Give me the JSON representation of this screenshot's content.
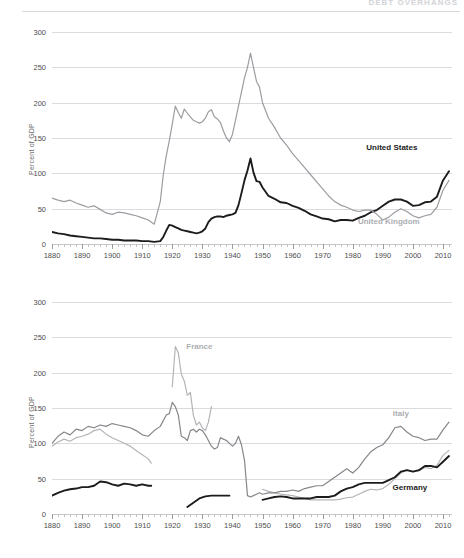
{
  "header": {
    "running_head": "DEBT OVERHANGS"
  },
  "chart_data": [
    {
      "id": "top",
      "type": "line",
      "title": "",
      "xlabel": "",
      "ylabel": "Percent of GDP",
      "xlim": [
        1880,
        2013
      ],
      "ylim": [
        0,
        300
      ],
      "yticks": [
        0,
        50,
        100,
        150,
        200,
        250,
        300
      ],
      "xticks": [
        1880,
        1890,
        1900,
        1910,
        1920,
        1930,
        1940,
        1950,
        1960,
        1970,
        1980,
        1990,
        2000,
        2010
      ],
      "grid": true,
      "legend_position": "inline-annotation",
      "annotations": [
        {
          "text": "United States",
          "x": 1993,
          "y": 137,
          "style": "dark"
        },
        {
          "text": "United Kingdom",
          "x": 1992,
          "y": 33,
          "style": "light"
        }
      ],
      "series": [
        {
          "name": "United States",
          "color": "#1c1c1c",
          "x": [
            1880,
            1882,
            1884,
            1886,
            1888,
            1890,
            1892,
            1894,
            1896,
            1898,
            1900,
            1902,
            1904,
            1906,
            1908,
            1910,
            1912,
            1914,
            1916,
            1917,
            1918,
            1919,
            1920,
            1921,
            1922,
            1923,
            1924,
            1925,
            1926,
            1927,
            1928,
            1929,
            1930,
            1931,
            1932,
            1933,
            1934,
            1935,
            1936,
            1937,
            1938,
            1939,
            1940,
            1941,
            1942,
            1943,
            1944,
            1945,
            1946,
            1947,
            1948,
            1949,
            1950,
            1952,
            1954,
            1956,
            1958,
            1960,
            1962,
            1964,
            1966,
            1968,
            1970,
            1972,
            1974,
            1976,
            1978,
            1980,
            1982,
            1984,
            1986,
            1988,
            1990,
            1992,
            1994,
            1996,
            1998,
            2000,
            2002,
            2004,
            2006,
            2008,
            2010,
            2012
          ],
          "values": [
            17,
            15,
            14,
            12,
            11,
            10,
            9,
            8,
            8,
            7,
            6,
            6,
            5,
            5,
            5,
            4,
            4,
            3,
            4,
            10,
            19,
            27,
            26,
            24,
            22,
            20,
            19,
            18,
            17,
            16,
            15,
            16,
            18,
            22,
            31,
            36,
            38,
            39,
            39,
            38,
            40,
            41,
            42,
            44,
            55,
            72,
            90,
            104,
            121,
            101,
            89,
            88,
            80,
            68,
            64,
            59,
            58,
            54,
            51,
            47,
            42,
            39,
            36,
            35,
            32,
            34,
            34,
            33,
            37,
            40,
            45,
            48,
            54,
            60,
            63,
            63,
            60,
            54,
            55,
            59,
            60,
            67,
            90,
            103
          ]
        },
        {
          "name": "United Kingdom",
          "color": "#9b9da0",
          "x": [
            1880,
            1882,
            1884,
            1886,
            1888,
            1890,
            1892,
            1894,
            1896,
            1898,
            1900,
            1902,
            1904,
            1906,
            1908,
            1910,
            1912,
            1914,
            1916,
            1917,
            1918,
            1919,
            1920,
            1921,
            1922,
            1923,
            1924,
            1925,
            1926,
            1927,
            1928,
            1929,
            1930,
            1931,
            1932,
            1933,
            1934,
            1935,
            1936,
            1937,
            1938,
            1939,
            1940,
            1941,
            1942,
            1943,
            1944,
            1945,
            1946,
            1947,
            1948,
            1949,
            1950,
            1952,
            1954,
            1956,
            1958,
            1960,
            1962,
            1964,
            1966,
            1968,
            1970,
            1972,
            1974,
            1976,
            1978,
            1980,
            1982,
            1984,
            1986,
            1988,
            1990,
            1992,
            1994,
            1996,
            1998,
            2000,
            2002,
            2004,
            2006,
            2008,
            2010,
            2012
          ],
          "values": [
            65,
            62,
            60,
            62,
            58,
            55,
            52,
            54,
            49,
            44,
            42,
            45,
            44,
            42,
            40,
            37,
            34,
            28,
            60,
            98,
            125,
            146,
            170,
            195,
            186,
            178,
            191,
            185,
            180,
            175,
            173,
            171,
            173,
            178,
            187,
            190,
            180,
            177,
            172,
            160,
            150,
            145,
            155,
            175,
            195,
            215,
            235,
            250,
            270,
            250,
            230,
            222,
            200,
            178,
            165,
            150,
            140,
            128,
            118,
            108,
            98,
            88,
            78,
            68,
            60,
            55,
            52,
            48,
            46,
            48,
            48,
            42,
            34,
            38,
            45,
            50,
            46,
            40,
            37,
            40,
            42,
            52,
            76,
            90
          ]
        }
      ]
    },
    {
      "id": "bottom",
      "type": "line",
      "title": "",
      "xlabel": "",
      "ylabel": "Percent of GDP",
      "xlim": [
        1880,
        2013
      ],
      "ylim": [
        0,
        300
      ],
      "yticks": [
        0,
        50,
        100,
        150,
        200,
        250,
        300
      ],
      "xticks": [
        1880,
        1890,
        1900,
        1910,
        1920,
        1930,
        1940,
        1950,
        1960,
        1970,
        1980,
        1990,
        2000,
        2010
      ],
      "grid": true,
      "legend_position": "inline-annotation",
      "annotations": [
        {
          "text": "France",
          "x": 1929,
          "y": 238,
          "style": "light"
        },
        {
          "text": "Italy",
          "x": 1996,
          "y": 143,
          "style": "light"
        },
        {
          "text": "Germany",
          "x": 1999,
          "y": 38,
          "style": "dark"
        }
      ],
      "series": [
        {
          "name": "France",
          "color": "#b4b5b8",
          "segments": [
            {
              "x": [
                1880,
                1882,
                1884,
                1886,
                1888,
                1890,
                1892,
                1894,
                1896,
                1898,
                1900,
                1902,
                1904,
                1906,
                1908,
                1910,
                1912,
                1913
              ],
              "values": [
                96,
                102,
                106,
                103,
                108,
                110,
                113,
                118,
                120,
                113,
                108,
                104,
                100,
                96,
                90,
                84,
                78,
                72
              ]
            },
            {
              "x": [
                1920,
                1921,
                1922,
                1923,
                1924,
                1925,
                1926,
                1927,
                1928,
                1929,
                1930,
                1931,
                1932,
                1933
              ],
              "values": [
                180,
                237,
                228,
                198,
                188,
                168,
                172,
                140,
                126,
                130,
                122,
                118,
                130,
                152
              ]
            },
            {
              "x": [
                1950,
                1952,
                1954,
                1956,
                1958,
                1960,
                1962,
                1964,
                1966,
                1968,
                1970,
                1972,
                1974,
                1976,
                1978,
                1980,
                1982,
                1984,
                1986,
                1988,
                1990,
                1992,
                1994,
                1996,
                1998,
                2000,
                2002,
                2004,
                2006,
                2008,
                2010,
                2012
              ],
              "values": [
                35,
                32,
                30,
                28,
                27,
                26,
                24,
                22,
                20,
                20,
                20,
                20,
                20,
                21,
                23,
                24,
                28,
                32,
                35,
                34,
                36,
                42,
                50,
                58,
                62,
                60,
                61,
                66,
                64,
                69,
                83,
                90
              ]
            }
          ]
        },
        {
          "name": "Italy",
          "color": "#85878a",
          "segments": [
            {
              "x": [
                1880,
                1882,
                1884,
                1886,
                1888,
                1890,
                1892,
                1894,
                1896,
                1898,
                1900,
                1902,
                1904,
                1906,
                1908,
                1910,
                1912,
                1914,
                1916,
                1918,
                1919,
                1920,
                1921,
                1922,
                1923,
                1924,
                1925,
                1926,
                1927,
                1928,
                1929,
                1930,
                1931,
                1932,
                1933,
                1934,
                1935,
                1936,
                1937,
                1938,
                1939,
                1940,
                1941,
                1942,
                1943,
                1944,
                1945,
                1946,
                1947,
                1948,
                1949,
                1950,
                1952,
                1954,
                1956,
                1958,
                1960,
                1962,
                1964,
                1966,
                1968,
                1970,
                1972,
                1974,
                1976,
                1978,
                1980,
                1982,
                1984,
                1986,
                1988,
                1990,
                1992,
                1994,
                1996,
                1998,
                2000,
                2002,
                2004,
                2006,
                2008,
                2010,
                2012
              ],
              "values": [
                100,
                110,
                116,
                112,
                120,
                118,
                124,
                122,
                126,
                124,
                128,
                126,
                124,
                122,
                118,
                112,
                110,
                118,
                124,
                140,
                142,
                158,
                152,
                140,
                110,
                108,
                104,
                118,
                120,
                116,
                120,
                118,
                112,
                104,
                96,
                92,
                94,
                108,
                106,
                104,
                100,
                96,
                100,
                110,
                98,
                76,
                26,
                24,
                26,
                28,
                30,
                28,
                30,
                30,
                32,
                32,
                34,
                32,
                36,
                38,
                40,
                40,
                46,
                52,
                58,
                64,
                58,
                66,
                78,
                88,
                94,
                98,
                108,
                122,
                124,
                116,
                110,
                108,
                104,
                106,
                106,
                119,
                130
              ]
            }
          ]
        },
        {
          "name": "Germany",
          "color": "#1c1c1c",
          "segments": [
            {
              "x": [
                1880,
                1882,
                1884,
                1886,
                1888,
                1890,
                1892,
                1894,
                1896,
                1898,
                1900,
                1902,
                1904,
                1906,
                1908,
                1910,
                1912,
                1913
              ],
              "values": [
                26,
                30,
                33,
                35,
                36,
                38,
                38,
                40,
                46,
                45,
                42,
                40,
                43,
                42,
                40,
                42,
                40,
                40
              ]
            },
            {
              "x": [
                1925,
                1927,
                1929,
                1931,
                1933,
                1935,
                1937,
                1939
              ],
              "values": [
                10,
                16,
                22,
                25,
                26,
                26,
                26,
                26
              ]
            },
            {
              "x": [
                1950,
                1952,
                1954,
                1956,
                1958,
                1960,
                1962,
                1964,
                1966,
                1968,
                1970,
                1972,
                1974,
                1976,
                1978,
                1980,
                1982,
                1984,
                1986,
                1988,
                1990,
                1992,
                1994,
                1996,
                1998,
                2000,
                2002,
                2004,
                2006,
                2008,
                2010,
                2012
              ],
              "values": [
                20,
                22,
                24,
                25,
                24,
                22,
                22,
                22,
                22,
                24,
                24,
                24,
                26,
                32,
                36,
                38,
                42,
                44,
                44,
                44,
                44,
                48,
                52,
                60,
                62,
                60,
                62,
                68,
                68,
                66,
                74,
                82
              ]
            }
          ]
        }
      ]
    }
  ]
}
